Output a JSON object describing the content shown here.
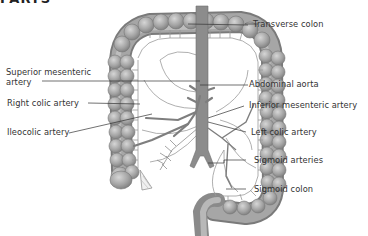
{
  "figure": {
    "clipped_heading": "PARTS",
    "labels_left": {
      "superior_mesenteric_line1": "Superior mesenteric",
      "superior_mesenteric_line2": "artery",
      "right_colic": "Right colic artery",
      "ileocolic": "Ileocolic artery"
    },
    "labels_right": {
      "transverse_colon": "Transverse colon",
      "abdominal_aorta": "Abdominal aorta",
      "inferior_mesenteric": "Inferior mesenteric artery",
      "left_colic": "Left colic artery",
      "sigmoid_arteries": "Sigmoid arteries",
      "sigmoid_colon": "Sigmoid colon"
    },
    "colors": {
      "colon_fill": "#9a9a9a",
      "colon_highlight": "#c8c8c8",
      "vessel": "#8c8c8c",
      "leader_line": "#333333",
      "text": "#333333"
    }
  }
}
